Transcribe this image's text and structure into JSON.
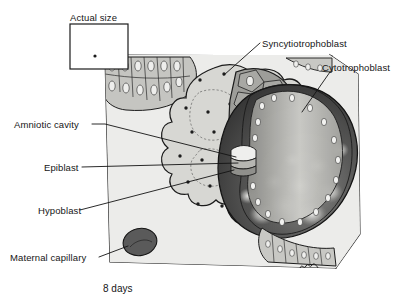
{
  "figure": {
    "caption": "8 days",
    "signature": "mc",
    "inset": {
      "title": "Actual size",
      "dot_label": "actual-size-dot"
    }
  },
  "labels": [
    {
      "id": "syncytiotrophoblast",
      "text": "Syncytiotrophoblast",
      "side": "right"
    },
    {
      "id": "cytotrophoblast",
      "text": "Cytotrophoblast",
      "side": "right"
    },
    {
      "id": "amniotic-cavity",
      "text": "Amniotic cavity",
      "side": "left"
    },
    {
      "id": "epiblast",
      "text": "Epiblast",
      "side": "left"
    },
    {
      "id": "hypoblast",
      "text": "Hypoblast",
      "side": "left"
    },
    {
      "id": "maternal-capillary",
      "text": "Maternal capillary",
      "side": "left"
    }
  ],
  "colors": {
    "page_background": "#ffffff",
    "ink": "#161616",
    "block_face": "#ececeb",
    "block_side": "#d9d9d6",
    "endometrium": "#c9c9c5",
    "syncytiotrophoblast": "#9a9a96",
    "cytotrophoblast": "#bdbdb9",
    "cell_nucleus": "#f0f0ee",
    "blastocyst_cavity_dark": "#3b3b3b",
    "blastocyst_cavity_mid": "#6e6e6e",
    "blastocyst_highlight": "#e6e6e4",
    "maternal_capillary": "#5c5c5c"
  }
}
